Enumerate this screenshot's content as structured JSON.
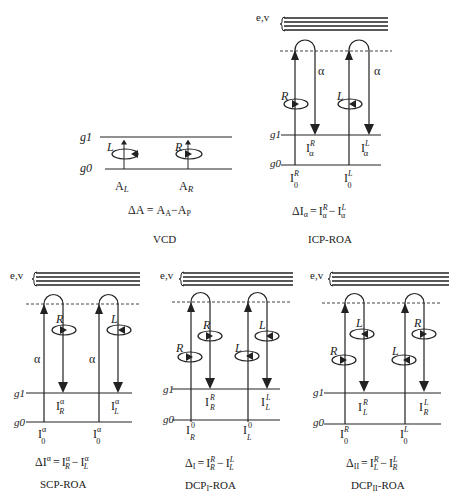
{
  "panels": {
    "vcd": {
      "title": "VCD",
      "levels": {
        "upper": "g1",
        "lower": "g0"
      },
      "transitions": [
        {
          "polarization": "L",
          "label": "A",
          "sub": "L"
        },
        {
          "polarization": "R",
          "label": "A",
          "sub": "R"
        }
      ],
      "equation": "ΔA = AA−AP",
      "equation_parts": {
        "lhs": "ΔA =",
        "a1": "A",
        "s1": "A",
        "minus": "−",
        "a2": "A",
        "s2": "P"
      }
    },
    "icp": {
      "title": "ICP-ROA",
      "band_label": "e,v",
      "levels": {
        "upper": "g1",
        "lower": "g0"
      },
      "scatter_label": "α",
      "transitions": [
        {
          "incident": "R",
          "scattered": "",
          "in_label": {
            "base": "I",
            "sup": "R",
            "sub": "0"
          },
          "out_label": {
            "base": "I",
            "sup": "R",
            "sub": "α"
          }
        },
        {
          "incident": "L",
          "scattered": "",
          "in_label": {
            "base": "I",
            "sup": "L",
            "sub": "0"
          },
          "out_label": {
            "base": "I",
            "sup": "L",
            "sub": "α"
          }
        }
      ],
      "equation_parts": {
        "lhs": "ΔI",
        "lhs_sub": "α",
        "eq": "=",
        "t1": "I",
        "t1_sup": "R",
        "t1_sub": "α",
        "minus": "−",
        "t2": "I",
        "t2_sup": "L",
        "t2_sub": "α"
      }
    },
    "scp": {
      "title": "SCP-ROA",
      "band_label": "e,v",
      "levels": {
        "upper": "g1",
        "lower": "g0"
      },
      "scatter_label": "α",
      "transitions": [
        {
          "incident": "",
          "scattered": "R",
          "in_label": {
            "base": "I",
            "sup": "α",
            "sub": "0"
          },
          "out_label": {
            "base": "I",
            "sup": "α",
            "sub": "R"
          }
        },
        {
          "incident": "",
          "scattered": "L",
          "in_label": {
            "base": "I",
            "sup": "α",
            "sub": "0"
          },
          "out_label": {
            "base": "I",
            "sup": "α",
            "sub": "L"
          }
        }
      ],
      "equation_parts": {
        "lhs": "ΔI",
        "lhs_sup": "α",
        "eq": "=",
        "t1": "I",
        "t1_sup": "α",
        "t1_sub": "R",
        "minus": "−",
        "t2": "I",
        "t2_sup": "α",
        "t2_sub": "L"
      }
    },
    "dcp1": {
      "title": "DCP",
      "title_sub": "I",
      "title_suffix": "-ROA",
      "band_label": "e,v",
      "levels": {
        "upper": "g1",
        "lower": "g0"
      },
      "transitions": [
        {
          "incident": "R",
          "scattered": "R",
          "in_label": {
            "base": "I",
            "sup": "0",
            "sub": "R"
          },
          "out_label": {
            "base": "I",
            "sup": "R",
            "sub": "R"
          }
        },
        {
          "incident": "L",
          "scattered": "L",
          "in_label": {
            "base": "I",
            "sup": "0",
            "sub": "L"
          },
          "out_label": {
            "base": "I",
            "sup": "L",
            "sub": "L"
          }
        }
      ],
      "equation_parts": {
        "lhs": "Δ",
        "lhs_sub": "I",
        "eq": "=",
        "t1": "I",
        "t1_sup": "R",
        "t1_sub": "R",
        "minus": "−",
        "t2": "I",
        "t2_sup": "L",
        "t2_sub": "L"
      }
    },
    "dcp2": {
      "title": "DCP",
      "title_sub": "II",
      "title_suffix": "-ROA",
      "band_label": "e,v",
      "levels": {
        "upper": "g1",
        "lower": "g0"
      },
      "transitions": [
        {
          "incident": "R",
          "scattered": "L",
          "in_label": {
            "base": "I",
            "sup": "R",
            "sub": "0"
          },
          "out_label": {
            "base": "I",
            "sup": "R",
            "sub": "L"
          }
        },
        {
          "incident": "L",
          "scattered": "R",
          "in_label": {
            "base": "I",
            "sup": "L",
            "sub": "0"
          },
          "out_label": {
            "base": "I",
            "sup": "L",
            "sub": "R"
          }
        }
      ],
      "equation_parts": {
        "lhs": "Δ",
        "lhs_sub": "II",
        "eq": "=",
        "t1": "I",
        "t1_sup": "R",
        "t1_sub": "L",
        "minus": "−",
        "t2": "I",
        "t2_sup": "L",
        "t2_sub": "R"
      }
    }
  }
}
